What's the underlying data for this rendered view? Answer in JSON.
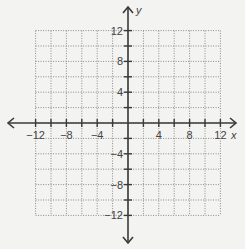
{
  "chart_data": {
    "type": "coordinate-plane",
    "title": "",
    "xlabel": "x",
    "ylabel": "y",
    "xlim": [
      -12,
      12
    ],
    "ylim": [
      -12,
      12
    ],
    "grid": true,
    "grid_step": 2,
    "grid_style": "dotted",
    "x_ticks": [
      -12,
      -10,
      -8,
      -6,
      -4,
      -2,
      2,
      4,
      6,
      8,
      10,
      12
    ],
    "y_ticks": [
      -12,
      -10,
      -8,
      -6,
      -4,
      -2,
      2,
      4,
      6,
      8,
      10,
      12
    ],
    "x_tick_labels": [
      "-12",
      "-8",
      "-4",
      "4",
      "8",
      "12"
    ],
    "y_tick_labels": [
      "12",
      "8",
      "4",
      "-4",
      "-8",
      "-12"
    ],
    "series": [],
    "axis_arrows": true
  },
  "labels": {
    "x_axis": "x",
    "y_axis": "y",
    "x_ticks": [
      {
        "value": -12,
        "text": "−12"
      },
      {
        "value": -8,
        "text": "−8"
      },
      {
        "value": -4,
        "text": "−4"
      },
      {
        "value": 4,
        "text": "4"
      },
      {
        "value": 8,
        "text": "8"
      },
      {
        "value": 12,
        "text": "12"
      }
    ],
    "y_ticks": [
      {
        "value": 12,
        "text": "12"
      },
      {
        "value": 8,
        "text": "8"
      },
      {
        "value": 4,
        "text": "4"
      },
      {
        "value": -4,
        "text": "−4"
      },
      {
        "value": -8,
        "text": "−8"
      },
      {
        "value": -12,
        "text": "−12"
      }
    ]
  },
  "colors": {
    "axis": "#3a3a3a",
    "grid": "#8a8a8a",
    "background": "#f3f3f1",
    "text": "#444444"
  }
}
